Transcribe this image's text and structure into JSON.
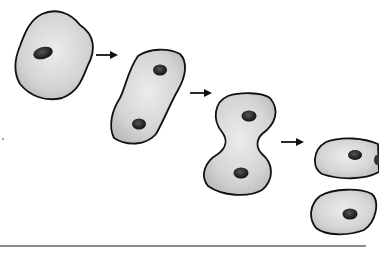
{
  "diagram": {
    "stages": [
      {
        "id": "stage-1",
        "description": "single cell with one nucleus"
      },
      {
        "id": "stage-2",
        "description": "elongated cell with two nuclei"
      },
      {
        "id": "stage-3",
        "description": "cell pinching in the middle"
      },
      {
        "id": "stage-4",
        "description": "two separate daughter cells"
      }
    ],
    "arrows": 3,
    "colors": {
      "cell_fill": "#d6d6d6",
      "cell_outline": "#111111",
      "nucleus": "#1e1e1e",
      "baseline": "#555555"
    }
  }
}
